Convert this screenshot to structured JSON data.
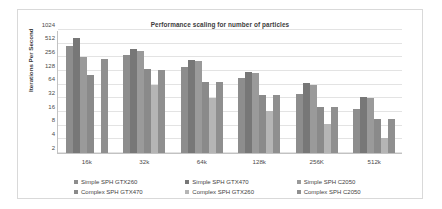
{
  "chart_data": {
    "type": "bar",
    "title": "Performance scaling for number of particles",
    "xlabel": "",
    "ylabel": "Iterations Per Second",
    "categories": [
      "16k",
      "32k",
      "64k",
      "128k",
      "256K",
      "512k"
    ],
    "yticks": [
      1024,
      512,
      256,
      128,
      64,
      32,
      16,
      8,
      4,
      2
    ],
    "ylim": [
      2,
      1024
    ],
    "yscale": "log2",
    "grid": true,
    "legend_position": "bottom",
    "series": [
      {
        "name": "Simple SPH GTX260",
        "color": "#8d8d8d",
        "values": [
          460,
          290,
          160,
          88,
          40,
          19
        ]
      },
      {
        "name": "Simple SPH GTX470",
        "color": "#777777",
        "values": [
          700,
          390,
          224,
          124,
          68,
          34
        ]
      },
      {
        "name": "Simple SPH C2050",
        "color": "#9a9a9a",
        "values": [
          256,
          360,
          216,
          116,
          62,
          32
        ]
      },
      {
        "name": "Complex SPH GTX470",
        "color": "#8a8a8a",
        "values": [
          105,
          140,
          72,
          38,
          21,
          11
        ]
      },
      {
        "name": "Complex SPH GTX260",
        "color": "#b5b5b5",
        "values": [
          2,
          64,
          33,
          17,
          8.5,
          4.2
        ]
      },
      {
        "name": "Complex SPH C2050",
        "color": "#8f8f8f",
        "values": [
          240,
          135,
          72,
          38,
          21,
          11
        ]
      }
    ]
  }
}
